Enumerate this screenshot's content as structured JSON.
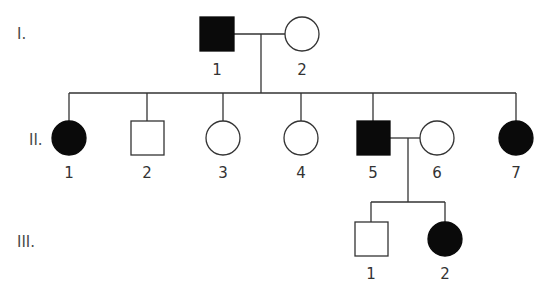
{
  "colors": {
    "affected": "#0a0a0a",
    "unaffected": "#ffffff",
    "line": "#333333",
    "label": "#4a4a4a"
  },
  "generations": [
    {
      "label": "I.",
      "y": 38
    },
    {
      "label": "II.",
      "y": 144
    },
    {
      "label": "III.",
      "y": 246
    }
  ],
  "individuals": [
    {
      "id": "I-1",
      "generation": "I",
      "number": "1",
      "sex": "male",
      "affected": true,
      "cx": 217,
      "cy": 34
    },
    {
      "id": "I-2",
      "generation": "I",
      "number": "2",
      "sex": "female",
      "affected": false,
      "cx": 302,
      "cy": 34
    },
    {
      "id": "II-1",
      "generation": "II",
      "number": "1",
      "sex": "female",
      "affected": true,
      "cx": 69,
      "cy": 138
    },
    {
      "id": "II-2",
      "generation": "II",
      "number": "2",
      "sex": "male",
      "affected": false,
      "cx": 147,
      "cy": 138
    },
    {
      "id": "II-3",
      "generation": "II",
      "number": "3",
      "sex": "female",
      "affected": false,
      "cx": 223,
      "cy": 138
    },
    {
      "id": "II-4",
      "generation": "II",
      "number": "4",
      "sex": "female",
      "affected": false,
      "cx": 301,
      "cy": 138
    },
    {
      "id": "II-5",
      "generation": "II",
      "number": "5",
      "sex": "male",
      "affected": true,
      "cx": 373,
      "cy": 138
    },
    {
      "id": "II-6",
      "generation": "II",
      "number": "6",
      "sex": "female",
      "affected": false,
      "cx": 437,
      "cy": 138
    },
    {
      "id": "II-7",
      "generation": "II",
      "number": "7",
      "sex": "female",
      "affected": true,
      "cx": 516,
      "cy": 138
    },
    {
      "id": "III-1",
      "generation": "III",
      "number": "1",
      "sex": "male",
      "affected": false,
      "cx": 371,
      "cy": 239
    },
    {
      "id": "III-2",
      "generation": "III",
      "number": "2",
      "sex": "female",
      "affected": true,
      "cx": 445,
      "cy": 239
    }
  ],
  "labels": {
    "gen_I": "I.",
    "gen_II": "II.",
    "gen_III": "III.",
    "I_1": "1",
    "I_2": "2",
    "II_1": "1",
    "II_2": "2",
    "II_3": "3",
    "II_4": "4",
    "II_5": "5",
    "II_6": "6",
    "II_7": "7",
    "III_1": "1",
    "III_2": "2"
  },
  "relationships": [
    {
      "type": "mating",
      "partners": [
        "I-1",
        "I-2"
      ],
      "children": [
        "II-1",
        "II-2",
        "II-3",
        "II-4",
        "II-5",
        "II-7"
      ]
    },
    {
      "type": "mating",
      "partners": [
        "II-5",
        "II-6"
      ],
      "children": [
        "III-1",
        "III-2"
      ]
    }
  ]
}
